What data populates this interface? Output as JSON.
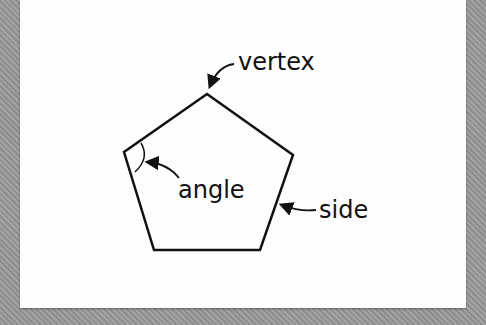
{
  "diagram": {
    "shape": "pentagon",
    "labels": {
      "vertex": "vertex",
      "angle": "angle",
      "side": "side"
    },
    "colors": {
      "background": "#999999",
      "card": "#fdfdfd",
      "stroke": "#111111"
    }
  }
}
